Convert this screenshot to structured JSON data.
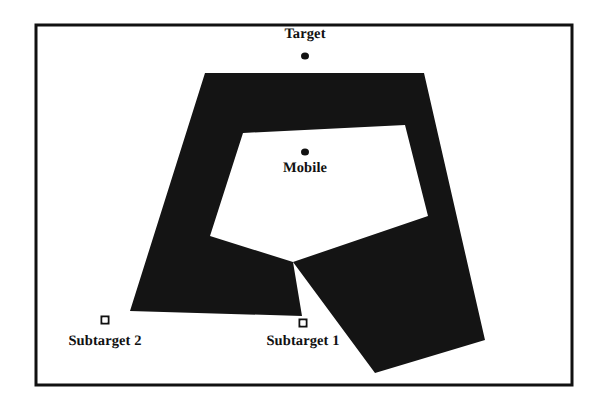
{
  "figure": {
    "background_color": "#ffffff",
    "ink_color": "#111111",
    "frame": {
      "name": "figure-border",
      "x": 36,
      "y": 25,
      "width": 536,
      "height": 360,
      "stroke_width": 3,
      "color": "#111111"
    },
    "obstacle": {
      "name": "c-shaped-obstacle",
      "fill": "#141414",
      "description": "Large filled C-shaped polygonal obstacle occupying the centre of the workspace",
      "outer_points": "205,73 424,73 485,340 375,373 293,262 302,316 130,311",
      "inner_points": "243,133 405,125 428,216 293,262 210,236"
    },
    "nodes": [
      {
        "id": "target",
        "label": "Target",
        "marker": "dot",
        "marker_x": 305,
        "marker_y": 56,
        "label_x": 305,
        "label_y": 26
      },
      {
        "id": "mobile",
        "label": "Mobile",
        "marker": "dot",
        "marker_x": 305,
        "marker_y": 152,
        "label_x": 305,
        "label_y": 160
      },
      {
        "id": "subtarget-1",
        "label": "Subtarget 1",
        "marker": "square",
        "marker_x": 303,
        "marker_y": 323,
        "label_x": 303,
        "label_y": 333
      },
      {
        "id": "subtarget-2",
        "label": "Subtarget 2",
        "marker": "square",
        "marker_x": 105,
        "marker_y": 320,
        "label_x": 105,
        "label_y": 333
      }
    ]
  }
}
